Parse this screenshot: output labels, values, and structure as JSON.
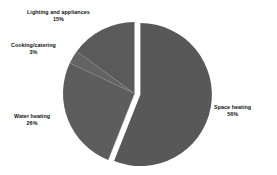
{
  "chart_data": {
    "type": "pie",
    "title": "",
    "subtitle": "",
    "xlabel": "",
    "ylabel": "",
    "legend_position": "none",
    "grid": false,
    "labels_outside": true,
    "categories": [
      "Space heating",
      "Water heating",
      "Cooking/catering",
      "Lighting and appliances"
    ],
    "values": [
      56,
      26,
      3,
      15
    ],
    "unit": "%",
    "slices": [
      {
        "name": "space-heating",
        "label": "Space heating",
        "value": 56,
        "percent_text": "56%",
        "color": "#585858",
        "exploded": true
      },
      {
        "name": "water-heating",
        "label": "Water heating",
        "value": 26,
        "percent_text": "26%",
        "color": "#5d5d5d",
        "exploded": false
      },
      {
        "name": "cooking-catering",
        "label": "Cooking/catering",
        "value": 3,
        "percent_text": "3%",
        "color": "#636363",
        "exploded": false
      },
      {
        "name": "lighting-and-appliances",
        "label": "Lighting and appliances",
        "value": 15,
        "percent_text": "15%",
        "color": "#5a5a5a",
        "exploded": false
      }
    ]
  },
  "style": {
    "background": "#ffffff",
    "separator_color": "#ffffff",
    "label_color": "#111111"
  }
}
